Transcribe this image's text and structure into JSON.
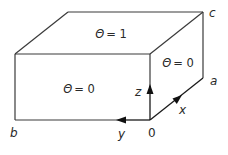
{
  "diagram": {
    "type": "3d-box-boundary-conditions",
    "faces": {
      "top": {
        "symbol": "Θ",
        "equals": "= 1"
      },
      "right": {
        "symbol": "Θ",
        "equals": "= 0"
      },
      "front": {
        "symbol": "Θ",
        "equals": "= 0"
      }
    },
    "corner_labels": {
      "c": "c",
      "a": "a",
      "b": "b",
      "origin": "0"
    },
    "axes": {
      "x": "x",
      "y": "y",
      "z": "z"
    },
    "colors": {
      "line": "#3a3a3a",
      "arrow": "#111111",
      "text": "#2a2a2a",
      "background": "#ffffff"
    }
  }
}
